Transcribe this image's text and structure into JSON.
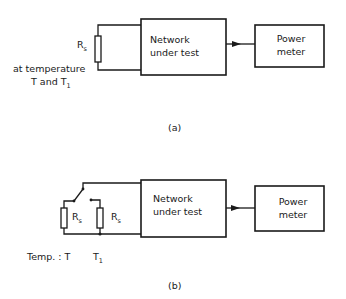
{
  "diagram_a": {
    "resistor_label": "R",
    "resistor_subscript": "s",
    "temperature_line1": "at temperature",
    "temperature_line2_prefix": "T and T",
    "temperature_line2_subscript": "1",
    "network_box": {
      "line1": "Network",
      "line2": "under test"
    },
    "power_meter_box": {
      "line1": "Power",
      "line2": "meter"
    },
    "caption": "(a)"
  },
  "diagram_b": {
    "resistor_left_label": "R",
    "resistor_left_subscript": "s",
    "resistor_right_label": "R",
    "resistor_right_subscript": "s",
    "temp_left": "Temp. : T",
    "temp_right_prefix": "T",
    "temp_right_subscript": "1",
    "network_box": {
      "line1": "Network",
      "line2": "under test"
    },
    "power_meter_box": {
      "line1": "Power",
      "line2": "meter"
    },
    "caption": "(b)"
  },
  "colors": {
    "line": "#1a1a1a",
    "background": "#ffffff"
  }
}
